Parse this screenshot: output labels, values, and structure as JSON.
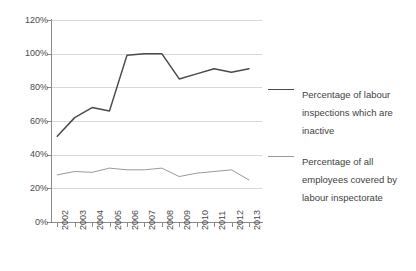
{
  "chart_data": {
    "type": "line",
    "title": "",
    "xlabel": "",
    "ylabel": "",
    "categories": [
      "2002",
      "2003",
      "2004",
      "2005",
      "2006",
      "2007",
      "2008",
      "2009",
      "2010",
      "2011",
      "2012",
      "2013"
    ],
    "ylim": [
      0,
      120
    ],
    "ytick_labels": [
      "0%",
      "20%",
      "40%",
      "60%",
      "80%",
      "100%",
      "120%"
    ],
    "ytick_values": [
      0,
      20,
      40,
      60,
      80,
      100,
      120
    ],
    "grid": true,
    "legend_position": "right",
    "series": [
      {
        "name": "Percentage of labour inspections which are inactive",
        "color": "#4a4a4a",
        "values": [
          51,
          62,
          68,
          66,
          99,
          100,
          100,
          85,
          88,
          91,
          89,
          91
        ]
      },
      {
        "name": "Percentage of all employees covered by labour inspectorate",
        "color": "#9a9a9a",
        "values": [
          28,
          30,
          29.5,
          32,
          31,
          31,
          32,
          27,
          29,
          30,
          31,
          25
        ]
      }
    ]
  },
  "legend": {
    "entries": [
      {
        "label": "Percentage of labour inspections which are inactive"
      },
      {
        "label": "Percentage of all employees covered by labour inspectorate"
      }
    ]
  },
  "colors": {
    "series_inactive": "#4a4a4a",
    "series_covered": "#9a9a9a",
    "grid": "#d9d9d9",
    "axis": "#8a8a8a",
    "background": "#ffffff"
  }
}
